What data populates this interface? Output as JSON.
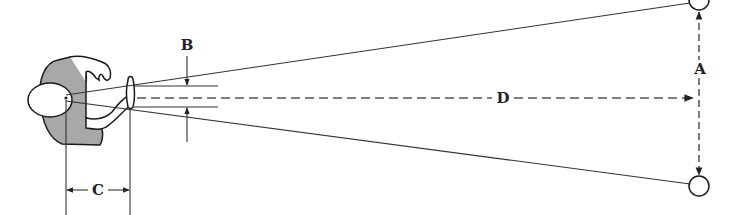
{
  "figure": {
    "type": "thumb-rule distance estimation diagram",
    "labels": {
      "A": "A",
      "B": "B",
      "C": "C",
      "D": "D"
    },
    "elements": {
      "observer": "top view of person with arm extended and thumb raised",
      "targets": [
        "top-circle",
        "bottom-circle"
      ],
      "sight_lines": 2
    },
    "colors": {
      "ink": "#1a1a1a",
      "shading": "#a8a8a8",
      "background": "#ffffff"
    }
  }
}
